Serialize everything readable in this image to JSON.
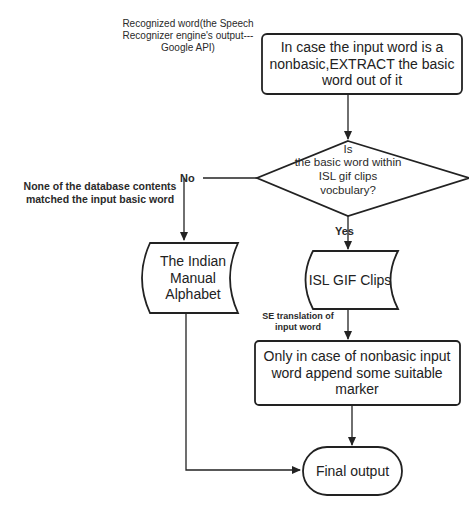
{
  "diagram": {
    "input_label": "Recognized word(the Speech Recognizer engine's output---Google API)",
    "nodes": {
      "extract": "In case the input word is a nonbasic,EXTRACT the basic word out of it",
      "decision_is": "Is",
      "decision_rest": "the basic word within ISL gif clips vocbulary?",
      "alphabet": "The Indian Manual Alphabet",
      "gif_clips": "ISL GIF Clips",
      "append_marker": "Only in case of nonbasic input word append some suitable marker",
      "final_output": "Final output"
    },
    "edges": {
      "no_label": "No",
      "yes_label": "Yes",
      "no_annotation": "None of the database contents matched the input basic word",
      "se_annotation": "SE translation of input word"
    },
    "colors": {
      "stroke": "#222222",
      "text": "#222222",
      "background": "#ffffff"
    }
  }
}
